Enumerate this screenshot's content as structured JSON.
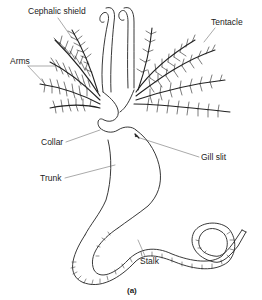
{
  "figure": {
    "caption": "(a)",
    "labels": {
      "cephalic_shield": "Cephalic shield",
      "tentacle": "Tentacle",
      "arms": "Arms",
      "collar": "Collar",
      "gill_slit": "Gill slit",
      "trunk": "Trunk",
      "stalk": "Stalk"
    },
    "colors": {
      "ink": "#222222",
      "background": "#ffffff"
    }
  }
}
